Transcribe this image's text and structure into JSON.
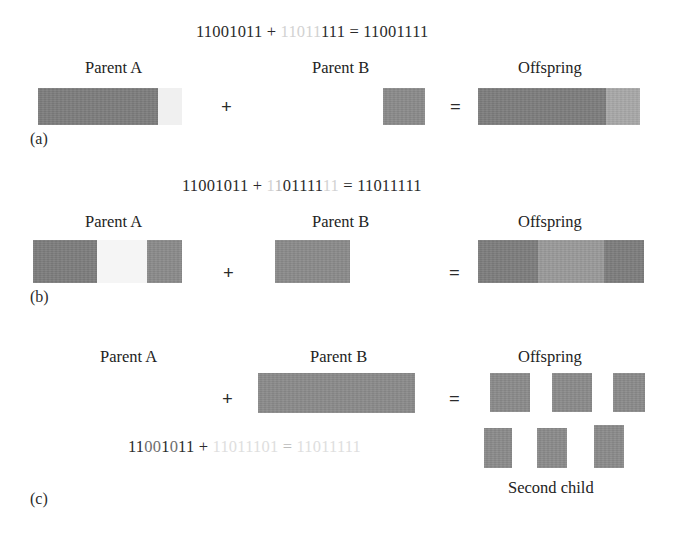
{
  "figure": {
    "caption_style": "crossover-operators-binary-strings",
    "colors": {
      "block_dark": "#7d7d7d",
      "block_mid": "#8a8a8a",
      "block_light": "#9a9a9a",
      "block_lighter": "#a8a8a8",
      "text_dark": "#2a2a2a",
      "text_gray": "#bcbcbc",
      "background": "#ffffff"
    }
  },
  "rows": [
    {
      "id": "a",
      "row_label": "(a)",
      "equation": {
        "parent_a": "11001011",
        "plus": "+",
        "parent_b": "11011111",
        "equals": "=",
        "offspring": "11001111",
        "full_text": "11001011 + 11011111 = 11001111"
      },
      "headers": {
        "parent_a": "Parent A",
        "parent_b": "Parent B",
        "offspring": "Offspring"
      },
      "operators": {
        "plus": "+",
        "equals": "="
      }
    },
    {
      "id": "b",
      "row_label": "(b)",
      "equation": {
        "parent_a": "11001011",
        "plus": "+",
        "parent_b": "11011111",
        "equals": "=",
        "offspring": "11011111",
        "full_text": "11001011 + 11011111 = 11011111"
      },
      "headers": {
        "parent_a": "Parent A",
        "parent_b": "Parent B",
        "offspring": "Offspring"
      },
      "operators": {
        "plus": "+",
        "equals": "="
      }
    },
    {
      "id": "c",
      "row_label": "(c)",
      "equation": {
        "parent_a": "11001011",
        "plus": "+",
        "parent_b": "11011101",
        "equals": "=",
        "offspring": "11011111",
        "full_text": "11001011 + 11011101 = 11011111"
      },
      "headers": {
        "parent_a": "Parent A",
        "parent_b": "Parent B",
        "offspring": "Offspring"
      },
      "operators": {
        "plus": "+",
        "equals": "="
      },
      "second_child_label": "Second child"
    }
  ],
  "eq_tokens": {
    "a": {
      "lhs": "11001011",
      "plus": "+",
      "rhs_gray": "11011",
      "rhs_dark": "111",
      "eqsign": "=",
      "result": "11001111"
    },
    "b": {
      "lhs": "11001011",
      "plus": "+",
      "rhs_g1": "1",
      "rhs_g2": "1",
      "rhs_d1": "011",
      "rhs_d2": "11",
      "rhs_g3": "1",
      "rhs_g4": "1",
      "eqsign": "=",
      "result": "11011111"
    },
    "c": {
      "lhs_d1": "11",
      "lhs_g1": "00",
      "lhs_d2": "1",
      "lhs_g2": "0",
      "lhs_d3": "11",
      "plus": "+",
      "rhs": "11011101",
      "eqsign": "=",
      "result": "11011111"
    }
  }
}
